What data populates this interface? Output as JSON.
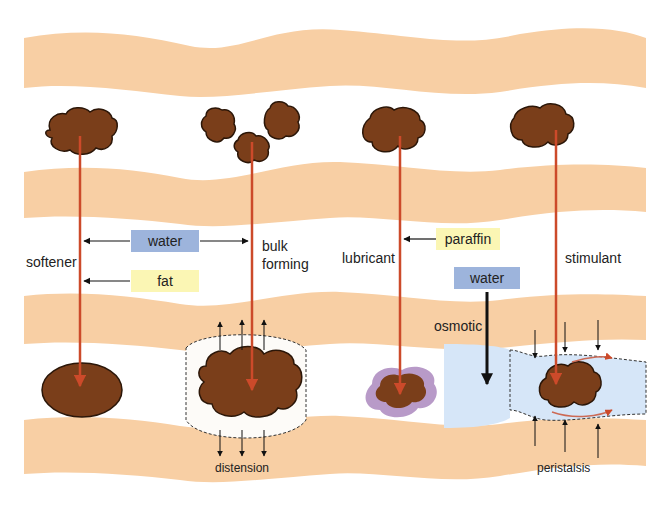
{
  "colors": {
    "gut_wall": "#f8cfa4",
    "lumen": "#fdfbf8",
    "stool": "#7a3e1a",
    "stool_outline": "#2b1608",
    "pointer_line": "#cc4a2a",
    "water_box": "#9db4dc",
    "oil_box": "#fbf6b4",
    "osmotic_fluid": "#d6e6f8",
    "lubricant_coat": "#b89ac8"
  },
  "labels": {
    "softener": "softener",
    "bulk_forming_line1": "bulk",
    "bulk_forming_line2": "forming",
    "lubricant": "lubricant",
    "stimulant": "stimulant",
    "osmotic": "osmotic",
    "distension": "distension",
    "peristalsis": "peristalsis"
  },
  "boxes": {
    "water_top": "water",
    "fat": "fat",
    "paraffin": "paraffin",
    "water_osmotic": "water"
  },
  "panels": [
    {
      "name": "softener",
      "agents": [
        "water",
        "fat"
      ],
      "result": "soft oval stool"
    },
    {
      "name": "bulk forming",
      "agents": [
        "water"
      ],
      "result": "enlarged stool",
      "effect": "distension"
    },
    {
      "name": "lubricant",
      "agents": [
        "paraffin"
      ],
      "result": "coated stool"
    },
    {
      "name": "osmotic",
      "agents": [
        "water"
      ],
      "result": "fluid-filled lumen"
    },
    {
      "name": "stimulant",
      "agents": [],
      "result": "propelled stool",
      "effect": "peristalsis"
    }
  ]
}
